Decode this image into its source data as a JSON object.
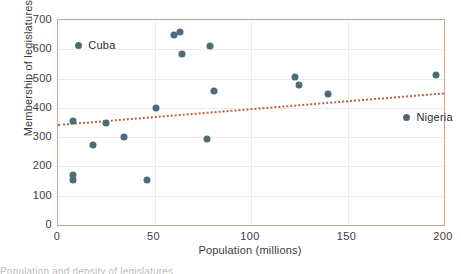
{
  "chart_data": {
    "type": "scatter",
    "title": "",
    "xlabel": "Population (millions)",
    "ylabel": "Membership of legislatures",
    "xlim": [
      0,
      200
    ],
    "ylim": [
      0,
      700
    ],
    "xticks": [
      0,
      50,
      100,
      150,
      200
    ],
    "yticks": [
      0,
      100,
      200,
      300,
      400,
      500,
      600,
      700
    ],
    "xtick_labels": [
      "0",
      "50",
      "100",
      "150",
      "200"
    ],
    "ytick_labels": [
      "0",
      "100",
      "200",
      "300",
      "400",
      "500",
      "600",
      "700"
    ],
    "grid": true,
    "legend_position": "none",
    "point_color": "#4f6b7a",
    "trend_color": "#b4644a",
    "frame_color": "#c9a896",
    "points": [
      {
        "x": 8,
        "y": 171
      },
      {
        "x": 8,
        "y": 154
      },
      {
        "x": 8,
        "y": 355
      },
      {
        "x": 18,
        "y": 273
      },
      {
        "x": 25,
        "y": 349
      },
      {
        "x": 34,
        "y": 300
      },
      {
        "x": 46,
        "y": 154
      },
      {
        "x": 51,
        "y": 400
      },
      {
        "x": 60,
        "y": 649
      },
      {
        "x": 63,
        "y": 660
      },
      {
        "x": 64,
        "y": 584
      },
      {
        "x": 77,
        "y": 294
      },
      {
        "x": 79,
        "y": 611
      },
      {
        "x": 81,
        "y": 457
      },
      {
        "x": 123,
        "y": 505
      },
      {
        "x": 125,
        "y": 478
      },
      {
        "x": 140,
        "y": 447
      },
      {
        "x": 196,
        "y": 513
      }
    ],
    "trend_line": {
      "style": "dotted",
      "x_start": 0,
      "y_start": 344,
      "x_end": 200,
      "y_end": 452
    },
    "annotations": [
      {
        "label": "Cuba",
        "marker_x": 9,
        "marker_y": 614,
        "text_offset": "right"
      },
      {
        "label": "Nigeria",
        "marker_x": 179,
        "marker_y": 368,
        "text_offset": "right"
      }
    ]
  },
  "caption": {
    "text": "Population and density of legislatures"
  }
}
